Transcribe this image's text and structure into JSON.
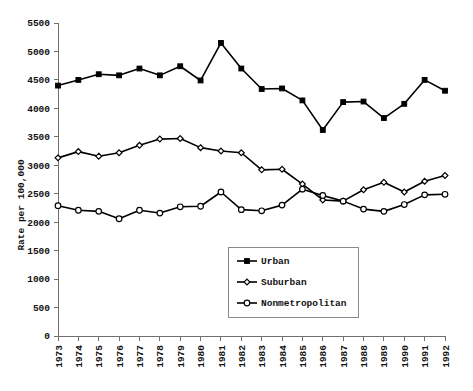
{
  "chart_data": {
    "type": "line",
    "title": "",
    "xlabel": "",
    "ylabel": "Rate per 100,000",
    "ylim": [
      0,
      5500
    ],
    "ytick_step": 500,
    "yticks": [
      0,
      500,
      1000,
      1500,
      2000,
      2500,
      3000,
      3500,
      4000,
      4500,
      5000,
      5500
    ],
    "ytick_labels": [
      "0",
      "500",
      "1000",
      "1500",
      "2000",
      "2500",
      "3000",
      "3500",
      "4000",
      "4500",
      "5000",
      "5500"
    ],
    "grid": false,
    "legend_position": "center",
    "categories": [
      "1973",
      "1974",
      "1975",
      "1976",
      "1977",
      "1978",
      "1979",
      "1980",
      "1981",
      "1982",
      "1983",
      "1984",
      "1985",
      "1986",
      "1987",
      "1988",
      "1989",
      "1990",
      "1991",
      "1992"
    ],
    "x": [
      1973,
      1974,
      1975,
      1976,
      1977,
      1978,
      1979,
      1980,
      1981,
      1982,
      1983,
      1984,
      1985,
      1986,
      1987,
      1988,
      1989,
      1990,
      1991,
      1992
    ],
    "series": [
      {
        "name": "Urban",
        "marker": "filled-square",
        "values": [
          4400,
          4500,
          4600,
          4580,
          4700,
          4580,
          4740,
          4490,
          5150,
          4700,
          4340,
          4350,
          4140,
          3620,
          4110,
          4120,
          3830,
          4080,
          4500,
          4310
        ]
      },
      {
        "name": "Suburban",
        "marker": "open-diamond",
        "values": [
          3130,
          3240,
          3160,
          3220,
          3350,
          3460,
          3470,
          3310,
          3250,
          3220,
          2920,
          2930,
          2670,
          2390,
          2370,
          2570,
          2700,
          2530,
          2720,
          2820
        ]
      },
      {
        "name": "Nonmetropolitan",
        "marker": "open-circle",
        "values": [
          2290,
          2210,
          2190,
          2060,
          2210,
          2160,
          2270,
          2280,
          2530,
          2220,
          2200,
          2300,
          2580,
          2470,
          2370,
          2230,
          2190,
          2310,
          2480,
          2490
        ]
      }
    ]
  },
  "legend": {
    "entries": [
      {
        "label": "Urban"
      },
      {
        "label": "Suburban"
      },
      {
        "label": "Nonmetropolitan"
      }
    ]
  },
  "axis": {
    "y_title": "Rate per 100,000"
  }
}
